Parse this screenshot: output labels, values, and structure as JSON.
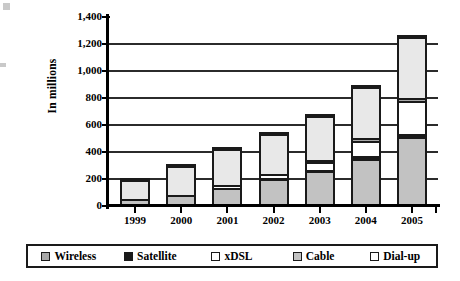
{
  "chart_data": {
    "type": "bar",
    "stacked": true,
    "title": "",
    "xlabel": "",
    "ylabel": "In millions",
    "ylim": [
      0,
      1400
    ],
    "ytick_step": 200,
    "ytick_labels": [
      "0",
      "200",
      "400",
      "600",
      "800",
      "1,000",
      "1,200",
      "1,400"
    ],
    "ytick_values": [
      0,
      200,
      400,
      600,
      800,
      1000,
      1200,
      1400
    ],
    "grid": true,
    "legend_position": "bottom",
    "categories": [
      "1999",
      "2000",
      "2001",
      "2002",
      "2003",
      "2004",
      "2005"
    ],
    "series": [
      {
        "name": "Cable",
        "color": "#c2c2c2",
        "values": [
          25,
          60,
          110,
          185,
          240,
          330,
          490
        ]
      },
      {
        "name": "Satellite",
        "color": "#1a1a1a",
        "values": [
          8,
          12,
          18,
          22,
          28,
          35,
          45
        ]
      },
      {
        "name": "xDSL",
        "color": "#ffffff",
        "values": [
          0,
          0,
          25,
          30,
          55,
          120,
          245
        ]
      },
      {
        "name": "Wireless",
        "color": "#a8a8a8",
        "values": [
          0,
          0,
          0,
          0,
          12,
          18,
          25
        ]
      },
      {
        "name": "Dial-up",
        "color": "#e8e8e8",
        "values": [
          177,
          238,
          282,
          308,
          345,
          397,
          465
        ]
      }
    ],
    "totals": [
      210,
      310,
      435,
      545,
      680,
      900,
      1270
    ]
  },
  "legend": {
    "items": [
      {
        "label": "Wireless",
        "swatch": "#a8a8a8"
      },
      {
        "label": "Satellite",
        "swatch": "#1a1a1a"
      },
      {
        "label": "xDSL",
        "swatch": "#ffffff"
      },
      {
        "label": "Cable",
        "swatch": "#c2c2c2"
      },
      {
        "label": "Dial-up",
        "swatch": "#ffffff"
      }
    ]
  }
}
